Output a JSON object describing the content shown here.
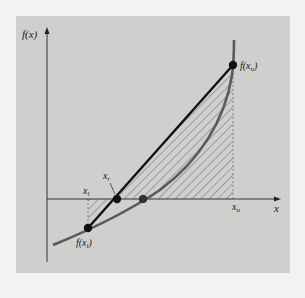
{
  "figure": {
    "type": "false-position-method-diagram",
    "background_panel_color": "#cfcfcd",
    "page_color": "#f2f2f0",
    "axes": {
      "y_label": "f(x)",
      "x_label": "x"
    },
    "points": {
      "f_xl": {
        "label": "f(x",
        "sub": "l",
        "close": ")"
      },
      "f_xu": {
        "label": "f(x",
        "sub": "u",
        "close": ")"
      },
      "x_l": {
        "label": "x",
        "sub": "l"
      },
      "x_r": {
        "label": "x",
        "sub": "r"
      },
      "x_u": {
        "label": "x",
        "sub": "u"
      }
    },
    "elements": {
      "curve": "f(x) function curve",
      "secant_line": "straight line from f(x_l) to f(x_u)",
      "hatched_region": "area between secant and axis",
      "true_root": "root of f(x) on x-axis"
    },
    "colors": {
      "curve": "#5a5a5a",
      "secant": "#111111",
      "axes": "#333333",
      "hatch": "#6a6a6a",
      "point": "#111111"
    }
  }
}
